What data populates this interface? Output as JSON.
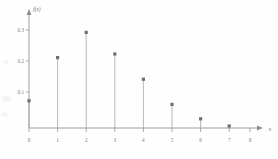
{
  "chart_data": {
    "type": "bar",
    "title": "",
    "subtitle": "",
    "xlabel": "x",
    "ylabel": "f(x)",
    "categories": [
      "0",
      "1",
      "2",
      "3",
      "4",
      "5",
      "6",
      "7"
    ],
    "x": [
      0,
      1,
      2,
      3,
      4,
      5,
      6,
      7
    ],
    "values": [
      0.08,
      0.2,
      0.27,
      0.21,
      0.14,
      0.07,
      0.03,
      0.01
    ],
    "xlim": [
      0,
      8
    ],
    "ylim": [
      0,
      0.32
    ],
    "x_tick_labels": [
      "0",
      "1",
      "2",
      "3",
      "4",
      "5",
      "6",
      "7",
      "8"
    ],
    "x_ticks": [
      0,
      1,
      2,
      3,
      4,
      5,
      6,
      7,
      8
    ],
    "y_tick_labels": [
      "0.1",
      "0.2",
      "0.3"
    ],
    "y_ticks": [
      0.1,
      0.2,
      0.3
    ],
    "grid": false,
    "legend": null,
    "legend_position": "none",
    "marker": "square",
    "style": "stem",
    "annotations": [],
    "colors": {
      "axis": "#8c8c8c",
      "stem": "#a0a0a0",
      "marker": "#6f6f6f",
      "text": "#7a7a7a",
      "background": "#fefefe"
    }
  },
  "figure": {
    "x_axis_arrow": true,
    "y_axis_arrow": true
  }
}
